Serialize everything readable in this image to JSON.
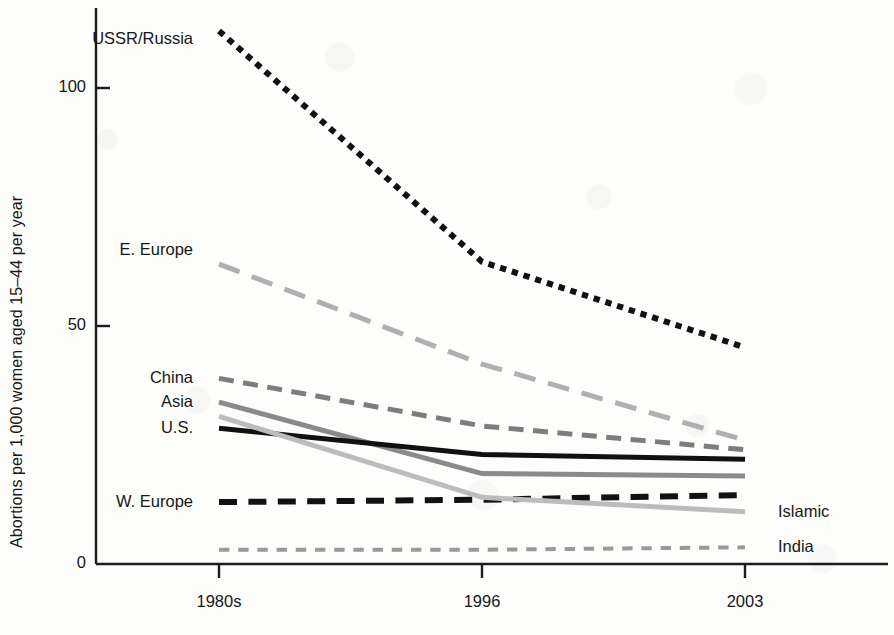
{
  "chart_data": {
    "type": "line",
    "title": "",
    "xlabel": "",
    "ylabel": "Abortions per 1,000 women aged 15–44 per year",
    "x": [
      "1980s",
      "1996",
      "2003"
    ],
    "categories": [
      "1980s",
      "1996",
      "2003"
    ],
    "xtick_labels": [
      "1980s",
      "1996",
      "2003"
    ],
    "ytick_labels": [
      "0",
      "50",
      "100"
    ],
    "ytick_values": [
      0,
      50,
      100
    ],
    "ylim": [
      0,
      117
    ],
    "grid": false,
    "legend": "inline-labels",
    "series": [
      {
        "name": "USSR/Russia",
        "label": "USSR/Russia",
        "label_side": "left",
        "values": [
          112,
          63.5,
          45.5
        ],
        "color": "#111111",
        "style": "dotted-square",
        "width": 6
      },
      {
        "name": "E. Europe",
        "label": "E. Europe",
        "label_side": "left",
        "values": [
          63,
          42,
          26
        ],
        "color": "#b0b0b0",
        "style": "long-dash",
        "width": 5
      },
      {
        "name": "China",
        "label": "China",
        "label_side": "left",
        "values": [
          39,
          29,
          24
        ],
        "color": "#7d7d7d",
        "style": "dash",
        "width": 5
      },
      {
        "name": "Asia",
        "label": "Asia",
        "label_side": "left",
        "values": [
          34,
          19,
          18.5
        ],
        "color": "#8a8a8a",
        "style": "solid",
        "width": 5
      },
      {
        "name": "U.S.",
        "label": "U.S.",
        "label_side": "left",
        "values": [
          28.5,
          23,
          22
        ],
        "color": "#111111",
        "style": "solid",
        "width": 5
      },
      {
        "name": "W. Europe",
        "label": "W. Europe",
        "label_side": "left",
        "values": [
          13,
          13.5,
          14.5
        ],
        "color": "#121212",
        "style": "dash",
        "width": 6
      },
      {
        "name": "Islamic",
        "label": "Islamic",
        "label_side": "right",
        "values": [
          31,
          14,
          11
        ],
        "color": "#bcbcbc",
        "style": "solid",
        "width": 5
      },
      {
        "name": "India",
        "label": "India",
        "label_side": "right",
        "values": [
          3,
          3,
          3.5
        ],
        "color": "#9a9a9a",
        "style": "fine-dash",
        "width": 4
      }
    ]
  },
  "axes": {
    "y_axis_title": "Abortions per 1,000 women aged 15–44 per year",
    "y_ticks": [
      {
        "label": "0",
        "value": 0
      },
      {
        "label": "50",
        "value": 50
      },
      {
        "label": "100",
        "value": 100
      }
    ],
    "x_ticks": [
      {
        "label": "1980s",
        "value": 0
      },
      {
        "label": "1996",
        "value": 1
      },
      {
        "label": "2003",
        "value": 2
      }
    ],
    "axis_color": "#1c1c1c"
  },
  "colors": {
    "background": "#fdfdfc",
    "axis": "#1c1c1c",
    "text": "#171717",
    "dark_series": "#111111",
    "mid_gray_series": "#7d7d7d",
    "light_gray_series": "#bcbcbc"
  }
}
